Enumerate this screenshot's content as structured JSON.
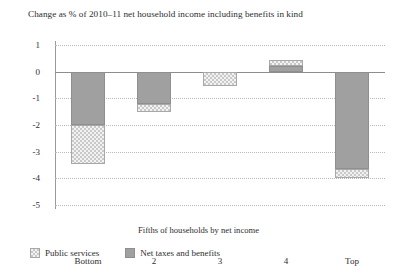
{
  "chart_data": {
    "type": "bar",
    "title": "Change as % of 2010–11 net household income including benefits in kind",
    "xlabel": "Fifths of households by net income",
    "ylabel": "",
    "categories": [
      "Bottom",
      "2",
      "3",
      "4",
      "Top"
    ],
    "ylim": [
      -5,
      1
    ],
    "yticks": [
      1,
      0,
      -1,
      -2,
      -3,
      -4,
      -5
    ],
    "ytick_labels": [
      "1",
      "0",
      "-1",
      "-2",
      "-3",
      "-4",
      "-5"
    ],
    "grid": true,
    "stacked": true,
    "legend_position": "bottom-left",
    "series": [
      {
        "name": "Net taxes and benefits",
        "style": "solid",
        "color": "#a0a0a0",
        "values": [
          -2.0,
          -1.2,
          0.0,
          0.22,
          -3.65
        ]
      },
      {
        "name": "Public services",
        "style": "hatched",
        "color": "#f2f2f2",
        "values": [
          -1.45,
          -0.3,
          -0.55,
          0.23,
          -0.35
        ]
      }
    ],
    "totals": [
      -3.45,
      -1.5,
      -0.55,
      0.45,
      -4.0
    ]
  },
  "legend": {
    "items": [
      {
        "label": "Public services",
        "style": "hatch"
      },
      {
        "label": "Net taxes and benefits",
        "style": "solid"
      }
    ]
  }
}
